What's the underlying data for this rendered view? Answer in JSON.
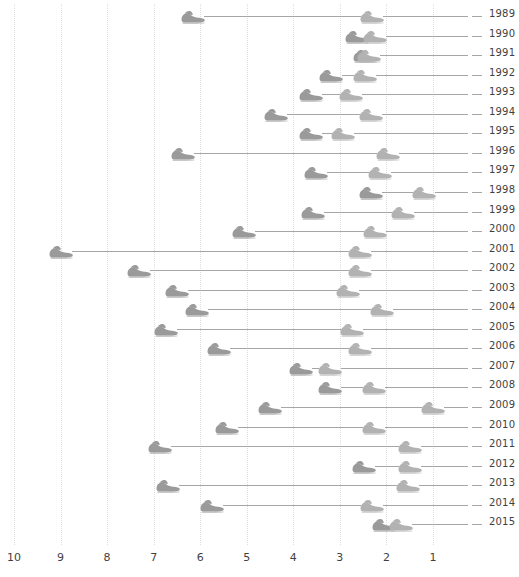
{
  "chart_data": {
    "type": "scatter",
    "title": "",
    "subtitle": "",
    "xlabel": "",
    "ylabel": "",
    "orientation": "horizontal",
    "x_axis": {
      "reversed": true,
      "ticks": [
        10,
        9,
        8,
        7,
        6,
        5,
        4,
        3,
        2,
        1
      ],
      "tick_labels": [
        "10",
        "9",
        "8",
        "7",
        "6",
        "5",
        "4",
        "3",
        "2",
        "1"
      ],
      "xlim": [
        10.3,
        0.55
      ],
      "grid": true
    },
    "y_axis": {
      "categories": [
        "1989",
        "1990",
        "1991",
        "1992",
        "1993",
        "1994",
        "1995",
        "1996",
        "1997",
        "1998",
        "1999",
        "2000",
        "2001",
        "2002",
        "2003",
        "2004",
        "2005",
        "2006",
        "2007",
        "2008",
        "2009",
        "2010",
        "2011",
        "2012",
        "2013",
        "2014",
        "2015"
      ],
      "label_position": "right",
      "grid": false
    },
    "series": [
      {
        "name": "start-marker",
        "marker": "shoe-icon",
        "color": "#9a9a9a"
      },
      {
        "name": "end-marker",
        "marker": "shoe-icon",
        "color": "#b2b2b2"
      }
    ],
    "legend": {
      "visible": false,
      "position": "none"
    },
    "rows": [
      {
        "year": "1989",
        "start": 6.15,
        "end": 2.3
      },
      {
        "year": "1990",
        "start": 2.63,
        "end": 2.25
      },
      {
        "year": "1991",
        "start": 2.45,
        "end": 2.37
      },
      {
        "year": "1992",
        "start": 3.2,
        "end": 2.46
      },
      {
        "year": "1993",
        "start": 3.63,
        "end": 2.77
      },
      {
        "year": "1994",
        "start": 4.38,
        "end": 2.33
      },
      {
        "year": "1995",
        "start": 3.63,
        "end": 2.94
      },
      {
        "year": "1996",
        "start": 6.38,
        "end": 1.97
      },
      {
        "year": "1997",
        "start": 3.52,
        "end": 2.14
      },
      {
        "year": "1998",
        "start": 2.33,
        "end": 1.19
      },
      {
        "year": "1999",
        "start": 3.58,
        "end": 1.64
      },
      {
        "year": "2000",
        "start": 5.05,
        "end": 2.24
      },
      {
        "year": "2001",
        "start": 8.99,
        "end": 2.56
      },
      {
        "year": "2002",
        "start": 7.31,
        "end": 2.56
      },
      {
        "year": "2003",
        "start": 6.49,
        "end": 2.82
      },
      {
        "year": "2004",
        "start": 6.06,
        "end": 2.09
      },
      {
        "year": "2005",
        "start": 6.73,
        "end": 2.74
      },
      {
        "year": "2006",
        "start": 5.59,
        "end": 2.56
      },
      {
        "year": "2007",
        "start": 3.84,
        "end": 3.22
      },
      {
        "year": "2008",
        "start": 3.22,
        "end": 2.26
      },
      {
        "year": "2009",
        "start": 4.51,
        "end": 1.0
      },
      {
        "year": "2010",
        "start": 5.43,
        "end": 2.26
      },
      {
        "year": "2011",
        "start": 6.87,
        "end": 1.5
      },
      {
        "year": "2012",
        "start": 2.48,
        "end": 1.5
      },
      {
        "year": "2013",
        "start": 6.7,
        "end": 1.54
      },
      {
        "year": "2014",
        "start": 5.75,
        "end": 2.3
      },
      {
        "year": "2015",
        "start": 2.05,
        "end": 1.69
      }
    ]
  },
  "colors": {
    "marker_start": "#9a9a9a",
    "marker_end": "#b2b2b2",
    "connector_line": "#a6a6a6",
    "gridline": "#dedede",
    "text": "#3f3f3f",
    "background": "#ffffff"
  },
  "icons": {
    "marker": "shoe-icon"
  }
}
